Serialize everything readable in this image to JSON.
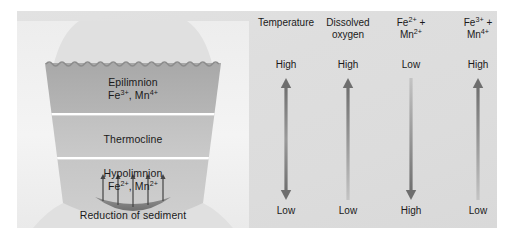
{
  "figure": {
    "width": 513,
    "height": 240,
    "background": "#ffffff",
    "panel_color": "#dedede"
  },
  "lake": {
    "strata": [
      {
        "name": "epilimnion",
        "label_line1": "Epilimnion",
        "species": [
          {
            "element": "Fe",
            "charge": "3+"
          },
          {
            "element": "Mn",
            "charge": "4+"
          }
        ],
        "label_line2_text": "Fe3+, Mn4+",
        "fill": "#b4b4b4"
      },
      {
        "name": "thermocline",
        "label_line1": "Thermocline",
        "species": [],
        "label_line2_text": "",
        "fill": "#c2c2c2"
      },
      {
        "name": "hypolimnion",
        "label_line1": "Hypolimnion",
        "species": [
          {
            "element": "Fe",
            "charge": "2+"
          },
          {
            "element": "Mn",
            "charge": "2+"
          }
        ],
        "label_line2_text": "Fe2+, Mn2+",
        "fill": "#c8c8c8"
      }
    ],
    "sediment_caption": "Reduction of sediment",
    "sediment_arrow_count": 5,
    "bank_color": "#f2f2f2",
    "surface_style": "wavy"
  },
  "columns": [
    {
      "id": "temperature",
      "title_line1": "Temperature",
      "title_line2": "",
      "title_sup1": "",
      "title_sup2": "",
      "top_label": "High",
      "bottom_label": "Low",
      "arrow_direction": "both",
      "gradient_top": "#6e6e6e",
      "gradient_bottom": "#6e6e6e"
    },
    {
      "id": "dissolved-oxygen",
      "title_line1": "Dissolved",
      "title_line2": "oxygen",
      "title_sup1": "",
      "title_sup2": "",
      "top_label": "High",
      "bottom_label": "Low",
      "arrow_direction": "up",
      "gradient_top": "#6e6e6e",
      "gradient_bottom": "#bdbdbd"
    },
    {
      "id": "fe2-mn2",
      "title_line1": "Fe",
      "title_sup1": "2+",
      "title_line1_suffix": " +",
      "title_line2": "Mn",
      "title_sup2": "2+",
      "top_label": "Low",
      "bottom_label": "High",
      "arrow_direction": "down",
      "gradient_top": "#bdbdbd",
      "gradient_bottom": "#6e6e6e"
    },
    {
      "id": "fe3-mn4",
      "title_line1": "Fe",
      "title_sup1": "3+",
      "title_line1_suffix": " +",
      "title_line2": "Mn",
      "title_sup2": "4+",
      "top_label": "High",
      "bottom_label": "Low",
      "arrow_direction": "up",
      "gradient_top": "#6e6e6e",
      "gradient_bottom": "#bdbdbd"
    }
  ]
}
